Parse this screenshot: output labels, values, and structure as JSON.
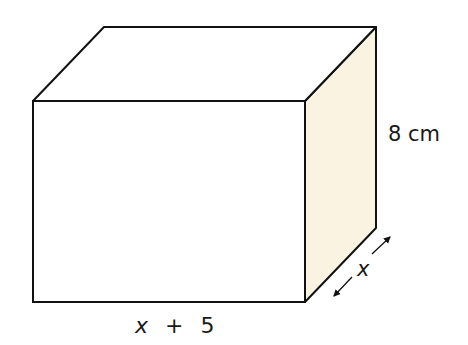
{
  "diagram": {
    "type": "rectangular prism (cuboid)",
    "colors": {
      "edge": "#111111",
      "front_face": "#ffffff",
      "top_face": "#ffffff",
      "side_face": "#fbf3e1"
    },
    "labels": {
      "height": "8 cm",
      "length_var": "x",
      "length_op": "+",
      "length_num": "5",
      "depth": "x"
    }
  }
}
